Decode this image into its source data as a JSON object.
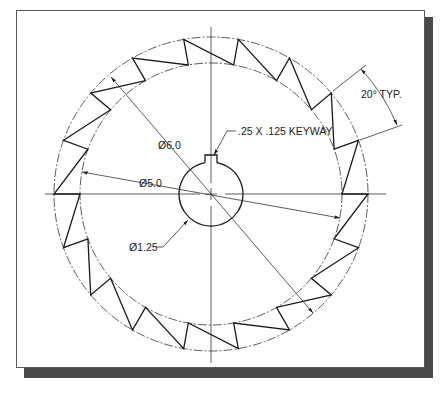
{
  "drawing": {
    "title": "Ratchet wheel with keyway",
    "colors": {
      "line": "#1a1a1a",
      "thin": "#333333",
      "shadow": "#4a4a4a",
      "frame": "#5a5a5a"
    },
    "geometry": {
      "center": [
        211,
        194
      ],
      "outer_radius": 157,
      "inner_radius": 131,
      "bore_radius": 32,
      "teeth_count": 18,
      "tooth_pitch_deg": 20,
      "keyway_width_px": 12,
      "keyway_top_y": 155
    },
    "labels": {
      "outer_diameter": "Ø6.0",
      "root_diameter": "Ø5.0",
      "bore_diameter": "Ø1.25",
      "keyway": ".25 X .125 KEYWAY",
      "angle": "20° TYP."
    }
  }
}
